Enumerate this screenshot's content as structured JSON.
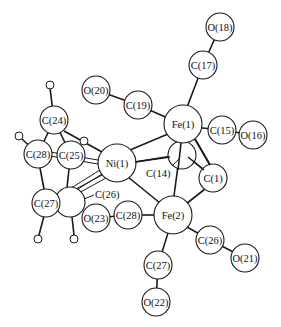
{
  "figure": {
    "type": "molecular-structure",
    "width": 281,
    "height": 327,
    "colors": {
      "line": "#1a1a1a",
      "fill": "#ffffff",
      "text": "#111111"
    }
  },
  "atoms": {
    "O18": {
      "label": "O(18)",
      "x": 220,
      "y": 27,
      "r": 14
    },
    "C17": {
      "label": "C(17)",
      "x": 203,
      "y": 65,
      "r": 14
    },
    "O20": {
      "label": "O(20)",
      "x": 96,
      "y": 90,
      "r": 14
    },
    "C19": {
      "label": "C(19)",
      "x": 138,
      "y": 105,
      "r": 14
    },
    "Fe1": {
      "label": "Fe(1)",
      "x": 183,
      "y": 124,
      "r": 19
    },
    "C15": {
      "label": "C(15)",
      "x": 222,
      "y": 130,
      "r": 14
    },
    "O16": {
      "label": "O(16)",
      "x": 253,
      "y": 135,
      "r": 14
    },
    "C24": {
      "label": "C(24)",
      "x": 54,
      "y": 120,
      "r": 14
    },
    "C28a": {
      "label": "C(28)",
      "x": 38,
      "y": 154,
      "r": 14
    },
    "C25": {
      "label": "C(25)",
      "x": 71,
      "y": 155,
      "r": 14
    },
    "Ni1": {
      "label": "Ni(1)",
      "x": 117,
      "y": 163,
      "r": 19
    },
    "C14": {
      "label": "C(14)",
      "x": 172,
      "y": 173,
      "r": 0
    },
    "C1": {
      "label": "C(1)",
      "x": 213,
      "y": 178,
      "r": 14
    },
    "C27a": {
      "label": "C(27)",
      "x": 46,
      "y": 203,
      "r": 14
    },
    "C26a": {
      "label": "C(26)",
      "x": 117,
      "y": 195,
      "r": 0
    },
    "O23": {
      "label": "O(23)",
      "x": 96,
      "y": 218,
      "r": 14
    },
    "C28b": {
      "label": "C(28)",
      "x": 128,
      "y": 215,
      "r": 14
    },
    "Fe2": {
      "label": "Fe(2)",
      "x": 173,
      "y": 215,
      "r": 19
    },
    "C26b": {
      "label": "C(26)",
      "x": 210,
      "y": 240,
      "r": 14
    },
    "O21": {
      "label": "O(21)",
      "x": 245,
      "y": 258,
      "r": 14
    },
    "C27b": {
      "label": "C(27)",
      "x": 158,
      "y": 265,
      "r": 14
    },
    "O22": {
      "label": "O(22)",
      "x": 156,
      "y": 302,
      "r": 14
    }
  },
  "unlabeled_atoms": [
    {
      "name": "c14-sphere",
      "x": 182,
      "y": 155,
      "r": 14
    },
    {
      "name": "c26-ring-sphere",
      "x": 70,
      "y": 202,
      "r": 15
    },
    {
      "name": "h-c24",
      "x": 50,
      "y": 86,
      "r": 4
    },
    {
      "name": "h-c28",
      "x": 20,
      "y": 137,
      "r": 4
    },
    {
      "name": "h-c25",
      "x": 84,
      "y": 141,
      "r": 4
    },
    {
      "name": "h-c27",
      "x": 38,
      "y": 238,
      "r": 4
    },
    {
      "name": "h-c26",
      "x": 74,
      "y": 238,
      "r": 4
    }
  ],
  "bonds": [
    [
      "O18",
      "C17"
    ],
    [
      "C17",
      "Fe1"
    ],
    [
      "O20",
      "C19"
    ],
    [
      "C19",
      "Fe1"
    ],
    [
      "Fe1",
      "C15"
    ],
    [
      "C15",
      "O16"
    ],
    [
      "Fe1",
      "Ni1"
    ],
    [
      "Fe1",
      "Fe2"
    ],
    [
      "Fe1",
      "C1"
    ],
    [
      "Ni1",
      "Fe2"
    ],
    [
      "Ni1",
      "c14"
    ],
    [
      "c14",
      "C1"
    ],
    [
      "C1",
      "Fe2"
    ],
    [
      "Fe2",
      "C28b"
    ],
    [
      "C28b",
      "O23"
    ],
    [
      "Fe2",
      "C26b"
    ],
    [
      "C26b",
      "O21"
    ],
    [
      "Fe2",
      "C27b"
    ],
    [
      "C27b",
      "O22"
    ],
    [
      "C24",
      "C28a"
    ],
    [
      "C24",
      "C25"
    ],
    [
      "C24",
      "Ni1"
    ],
    [
      "C28a",
      "C27a"
    ],
    [
      "C25",
      "c26ring"
    ],
    [
      "C27a",
      "c26ring"
    ]
  ],
  "labels": {
    "O18": "O(18)",
    "C17": "C(17)",
    "O20": "O(20)",
    "C19": "C(19)",
    "Fe1": "Fe(1)",
    "C15": "C(15)",
    "O16": "O(16)",
    "C24": "C(24)",
    "C28a": "C(28)",
    "C25": "C(25)",
    "Ni1": "Ni(1)",
    "C14": "C(14)",
    "C1": "C(1)",
    "C27a": "C(27)",
    "C26a": "C(26)",
    "O23": "O(23)",
    "C28b": "C(28)",
    "Fe2": "Fe(2)",
    "C26b": "C(26)",
    "O21": "O(21)",
    "C27b": "C(27)",
    "O22": "O(22)"
  }
}
